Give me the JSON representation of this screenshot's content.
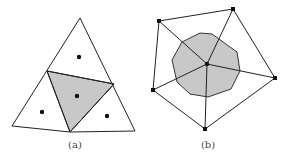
{
  "panels": [
    {
      "label": "(a)",
      "outer_triangle": [
        [
          80,
          18
        ],
        [
          12,
          126
        ],
        [
          70,
          132
        ],
        [
          135,
          131
        ]
      ],
      "inner_triangle": [
        [
          47,
          71
        ],
        [
          114,
          84
        ],
        [
          70,
          132
        ]
      ],
      "points": [
        [
          79,
          57
        ],
        [
          77,
          96
        ],
        [
          42,
          112
        ],
        [
          107,
          116
        ]
      ]
    },
    {
      "label": "(b)",
      "outer_polygon": [
        [
          159,
          21
        ],
        [
          233,
          9
        ],
        [
          275,
          78
        ],
        [
          205,
          129
        ],
        [
          153,
          90
        ]
      ],
      "center": [
        207,
        64
      ],
      "cell_polygon": [
        [
          200,
          33
        ],
        [
          212,
          34
        ],
        [
          237,
          52
        ],
        [
          240,
          71
        ],
        [
          231,
          89
        ],
        [
          208,
          97
        ],
        [
          190,
          94
        ],
        [
          177,
          82
        ],
        [
          172,
          60
        ],
        [
          182,
          42
        ]
      ]
    }
  ],
  "colors": {
    "stroke": "#222222",
    "fill": "#c8c8c8",
    "point": "#111111"
  }
}
